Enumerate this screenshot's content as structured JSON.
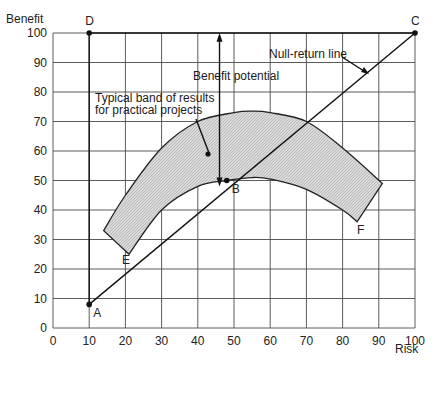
{
  "chart_data": {
    "type": "line",
    "title": "",
    "xlabel": "Risk",
    "ylabel": "Benefit",
    "xlim": [
      0,
      100
    ],
    "ylim": [
      0,
      100
    ],
    "grid": true,
    "xticks": [
      0,
      10,
      20,
      30,
      40,
      50,
      60,
      70,
      80,
      90,
      100
    ],
    "yticks": [
      0,
      10,
      20,
      30,
      40,
      50,
      60,
      70,
      80,
      90,
      100
    ],
    "points": [
      {
        "label": "A",
        "x": 10,
        "y": 8
      },
      {
        "label": "B",
        "x": 48,
        "y": 50
      },
      {
        "label": "C",
        "x": 100,
        "y": 100
      },
      {
        "label": "D",
        "x": 10,
        "y": 100
      },
      {
        "label": "E",
        "x": 21,
        "y": 25
      },
      {
        "label": "F",
        "x": 84,
        "y": 36
      }
    ],
    "series": [
      {
        "name": "Null-return line",
        "x": [
          10,
          100
        ],
        "y": [
          8,
          100
        ]
      },
      {
        "name": "Boundary A-D",
        "x": [
          10,
          10
        ],
        "y": [
          8,
          100
        ]
      },
      {
        "name": "Boundary D-C",
        "x": [
          10,
          100
        ],
        "y": [
          100,
          100
        ]
      },
      {
        "name": "Typical band upper edge",
        "x": [
          14,
          20,
          30,
          40,
          50,
          55,
          60,
          70,
          80,
          91
        ],
        "y": [
          33,
          45,
          61,
          70,
          73,
          73.5,
          73,
          70,
          61,
          49
        ]
      },
      {
        "name": "Typical band lower edge",
        "x": [
          21,
          30,
          40,
          48,
          55,
          60,
          70,
          80,
          84
        ],
        "y": [
          25,
          40,
          48,
          50,
          51,
          50.5,
          47,
          40,
          36
        ]
      }
    ],
    "annotations": [
      {
        "text": "Benefit potential",
        "x": 46,
        "y": 92,
        "arrow": "double vertical from 48 to 100 at x=46"
      },
      {
        "text": "Typical band of results",
        "x": 13,
        "y": 81
      },
      {
        "text": "for practical projects",
        "x": 13,
        "y": 77
      },
      {
        "text": "Null-return line",
        "x": 68,
        "y": 93,
        "arrow_to": [
          85,
          86
        ]
      }
    ]
  },
  "labels": {
    "ylabel": "Benefit",
    "xlabel": "Risk",
    "benefit_potential": "Benefit potential",
    "band_line1": "Typical band of results",
    "band_line2": "for practical projects",
    "null_return": "Null-return line",
    "A": "A",
    "B": "B",
    "C": "C",
    "D": "D",
    "E": "E",
    "F": "F"
  }
}
